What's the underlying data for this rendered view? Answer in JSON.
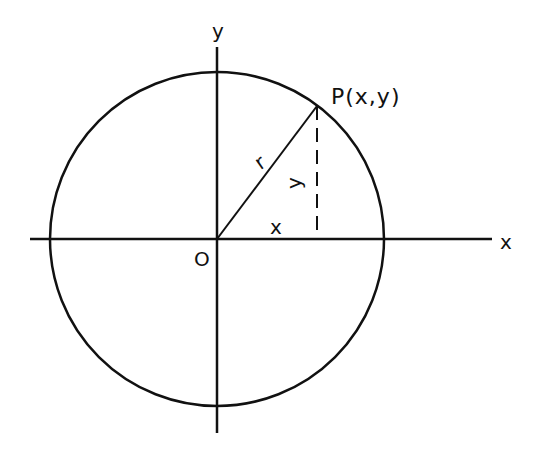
{
  "diagram": {
    "labels": {
      "y_axis": "y",
      "x_axis": "x",
      "origin": "O",
      "point": "P(x,y)",
      "radius": "r",
      "x_leg": "x",
      "y_leg": "y"
    },
    "colors": {
      "stroke": "#111111",
      "background": "#ffffff"
    }
  }
}
